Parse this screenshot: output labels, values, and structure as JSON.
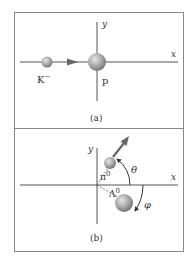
{
  "panel_a": {
    "x_label": "x",
    "y_label": "y",
    "incoming_particle": "K",
    "incoming_charge": "−",
    "target_particle": "p",
    "caption": "(a)"
  },
  "panel_b": {
    "x_label": "x",
    "y_label": "y",
    "particle_1": "π",
    "particle_1_charge": "0",
    "particle_2": "Λ",
    "particle_2_charge": "0",
    "angle_1": "θ",
    "angle_2": "φ",
    "caption": "(b)"
  },
  "colors": {
    "axis": "#555555",
    "border": "#777777",
    "ball_light": "#d8d8d8",
    "ball_dark": "#7a7a7a",
    "arrow": "#666666"
  }
}
